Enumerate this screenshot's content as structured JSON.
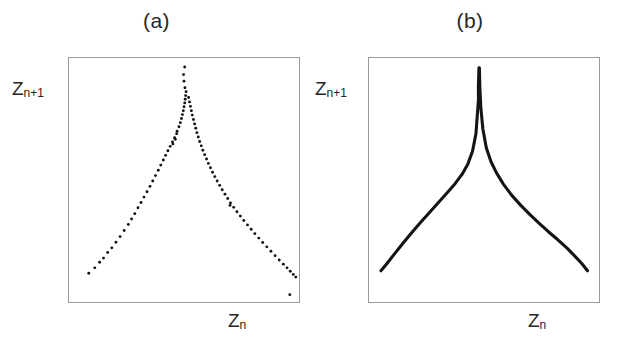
{
  "figure": {
    "panels": [
      {
        "id": "a",
        "title": "(a)",
        "xlabel_base": "Z",
        "xlabel_sub": "n",
        "ylabel_base": "Z",
        "ylabel_sub": "n+1"
      },
      {
        "id": "b",
        "title": "(b)",
        "xlabel_base": "Z",
        "xlabel_sub": "n",
        "ylabel_base": "Z",
        "ylabel_sub": "n+1"
      }
    ]
  },
  "colors": {
    "frame": "#9a9a96",
    "data": "#111111",
    "curve": "#141414",
    "background": "#ffffff",
    "text": "#262626"
  },
  "chart_data": [
    {
      "type": "scatter",
      "title": "(a)",
      "xlabel": "Z_n",
      "ylabel": "Z_n+1",
      "xlim": [
        0,
        1
      ],
      "ylim": [
        0,
        1
      ],
      "grid": false,
      "legend": null,
      "marker": "dot",
      "description": "Return map of successive maxima showing a tent-like cusp attractor reconstructed from data points",
      "points": [
        [
          0.086,
          0.118
        ],
        [
          0.112,
          0.14
        ],
        [
          0.133,
          0.163
        ],
        [
          0.15,
          0.18
        ],
        [
          0.168,
          0.203
        ],
        [
          0.186,
          0.222
        ],
        [
          0.204,
          0.245
        ],
        [
          0.222,
          0.268
        ],
        [
          0.24,
          0.293
        ],
        [
          0.258,
          0.318
        ],
        [
          0.272,
          0.34
        ],
        [
          0.286,
          0.362
        ],
        [
          0.3,
          0.386
        ],
        [
          0.313,
          0.408
        ],
        [
          0.326,
          0.43
        ],
        [
          0.339,
          0.452
        ],
        [
          0.352,
          0.474
        ],
        [
          0.364,
          0.496
        ],
        [
          0.376,
          0.518
        ],
        [
          0.388,
          0.54
        ],
        [
          0.399,
          0.561
        ],
        [
          0.41,
          0.582
        ],
        [
          0.42,
          0.601
        ],
        [
          0.43,
          0.62
        ],
        [
          0.44,
          0.638
        ],
        [
          0.45,
          0.656
        ],
        [
          0.459,
          0.673
        ],
        [
          0.468,
          0.69
        ],
        [
          0.452,
          0.648
        ],
        [
          0.462,
          0.667
        ],
        [
          0.47,
          0.7
        ],
        [
          0.478,
          0.718
        ],
        [
          0.484,
          0.735
        ],
        [
          0.489,
          0.752
        ],
        [
          0.493,
          0.768
        ],
        [
          0.497,
          0.784
        ],
        [
          0.5,
          0.8
        ],
        [
          0.503,
          0.816
        ],
        [
          0.505,
          0.831
        ],
        [
          0.507,
          0.846
        ],
        [
          0.509,
          0.862
        ],
        [
          0.504,
          0.878
        ],
        [
          0.5,
          0.905
        ],
        [
          0.498,
          0.932
        ],
        [
          0.503,
          0.963
        ],
        [
          0.52,
          0.838
        ],
        [
          0.524,
          0.82
        ],
        [
          0.528,
          0.802
        ],
        [
          0.532,
          0.784
        ],
        [
          0.536,
          0.766
        ],
        [
          0.541,
          0.748
        ],
        [
          0.546,
          0.73
        ],
        [
          0.551,
          0.712
        ],
        [
          0.556,
          0.694
        ],
        [
          0.562,
          0.676
        ],
        [
          0.568,
          0.658
        ],
        [
          0.575,
          0.64
        ],
        [
          0.582,
          0.622
        ],
        [
          0.59,
          0.604
        ],
        [
          0.598,
          0.586
        ],
        [
          0.606,
          0.568
        ],
        [
          0.615,
          0.55
        ],
        [
          0.624,
          0.532
        ],
        [
          0.634,
          0.514
        ],
        [
          0.644,
          0.496
        ],
        [
          0.655,
          0.478
        ],
        [
          0.666,
          0.46
        ],
        [
          0.678,
          0.442
        ],
        [
          0.69,
          0.424
        ],
        [
          0.702,
          0.406
        ],
        [
          0.7,
          0.396
        ],
        [
          0.716,
          0.388
        ],
        [
          0.73,
          0.37
        ],
        [
          0.745,
          0.352
        ],
        [
          0.76,
          0.334
        ],
        [
          0.776,
          0.316
        ],
        [
          0.792,
          0.298
        ],
        [
          0.808,
          0.28
        ],
        [
          0.825,
          0.262
        ],
        [
          0.842,
          0.244
        ],
        [
          0.86,
          0.226
        ],
        [
          0.878,
          0.208
        ],
        [
          0.896,
          0.19
        ],
        [
          0.914,
          0.172
        ],
        [
          0.932,
          0.155
        ],
        [
          0.948,
          0.14
        ],
        [
          0.962,
          0.126
        ],
        [
          0.975,
          0.113
        ],
        [
          0.986,
          0.102
        ],
        [
          0.96,
          0.03
        ]
      ]
    },
    {
      "type": "line",
      "title": "(b)",
      "xlabel": "Z_n",
      "ylabel": "Z_n+1",
      "xlim": [
        0,
        1
      ],
      "ylim": [
        0,
        1
      ],
      "grid": false,
      "legend": null,
      "description": "Smooth theoretical cusp return map with a sharp singular maximum",
      "x": [
        0.052,
        0.08,
        0.11,
        0.145,
        0.18,
        0.22,
        0.26,
        0.3,
        0.34,
        0.375,
        0.405,
        0.43,
        0.45,
        0.465,
        0.476,
        0.4755,
        0.478,
        0.48,
        0.482,
        0.486,
        0.495,
        0.51,
        0.53,
        0.555,
        0.585,
        0.62,
        0.66,
        0.7,
        0.74,
        0.78,
        0.82,
        0.86,
        0.895,
        0.925,
        0.95
      ],
      "y": [
        0.128,
        0.16,
        0.196,
        0.238,
        0.278,
        0.322,
        0.364,
        0.406,
        0.448,
        0.486,
        0.524,
        0.566,
        0.618,
        0.69,
        0.83,
        0.88,
        0.96,
        0.96,
        0.88,
        0.8,
        0.71,
        0.632,
        0.576,
        0.528,
        0.482,
        0.438,
        0.396,
        0.358,
        0.322,
        0.288,
        0.256,
        0.222,
        0.188,
        0.158,
        0.128
      ]
    }
  ]
}
